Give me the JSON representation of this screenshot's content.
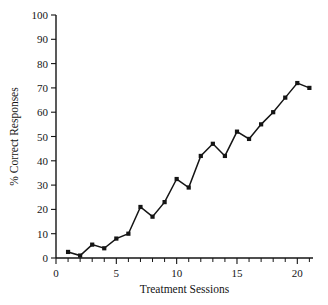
{
  "chart_data": {
    "type": "line",
    "title": "",
    "xlabel": "Treatment Sessions",
    "ylabel": "% Correct Responses",
    "x": [
      1,
      2,
      3,
      4,
      5,
      6,
      7,
      8,
      9,
      10,
      11,
      12,
      13,
      14,
      15,
      16,
      17,
      18,
      19,
      20,
      21
    ],
    "values": [
      2.5,
      1,
      5.5,
      4,
      8,
      10,
      21,
      17,
      23,
      32.5,
      29,
      42,
      47,
      42,
      52,
      49,
      55,
      60,
      66,
      72,
      70
    ],
    "series": [
      {
        "name": "% Correct Responses",
        "values": [
          2.5,
          1,
          5.5,
          4,
          8,
          10,
          21,
          17,
          23,
          32.5,
          29,
          42,
          47,
          42,
          52,
          49,
          55,
          60,
          66,
          72,
          70
        ]
      }
    ],
    "xlim": [
      0,
      21.3
    ],
    "ylim": [
      0,
      100
    ],
    "xticks": [
      0,
      5,
      10,
      15,
      20
    ],
    "xtick_labels": [
      "0",
      "5",
      "10",
      "15",
      "20"
    ],
    "xticks_minor": [
      1,
      2,
      3,
      4,
      6,
      7,
      8,
      9,
      11,
      12,
      13,
      14,
      16,
      17,
      18,
      19,
      21
    ],
    "yticks": [
      0,
      10,
      20,
      30,
      40,
      50,
      60,
      70,
      80,
      90,
      100
    ],
    "ytick_labels": [
      "0",
      "10",
      "20",
      "30",
      "40",
      "50",
      "60",
      "70",
      "80",
      "90",
      "100"
    ],
    "grid": false,
    "legend": "none",
    "marker": "square",
    "line_color": "#151515",
    "marker_color": "#151515",
    "background": "#ffffff"
  }
}
